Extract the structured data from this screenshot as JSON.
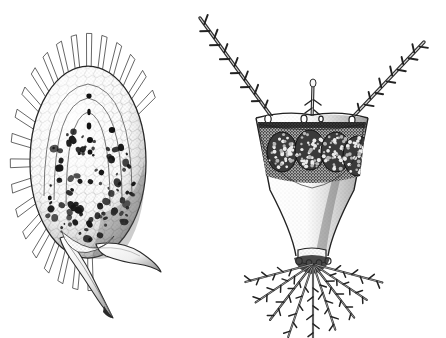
{
  "plate": {
    "title": "Zooplankton pen-and-ink plate",
    "width": 446,
    "height": 338,
    "background_color": "#ffffff",
    "ink_color": "#1a1a1a",
    "mid_tone_color": "#6e6e6e",
    "light_tone_color": "#c9c9c9",
    "technique": "stipple-and-line pen drawing",
    "figure_count": 2,
    "caption": "",
    "labels": []
  },
  "figures": [
    {
      "id": "left-specimen",
      "name": "loricate-rotifer-with-caudal-spines",
      "position": {
        "x": 18,
        "y": 22,
        "width": 150,
        "height": 300
      },
      "description": "Ovoid lorica crowned by a fan of radiating rectangular plates, interior densely packed with dark ovarian granules, terminating in two curved caudal spines.",
      "parts": [
        {
          "name": "apical-plate-crown",
          "count": 22,
          "shape": "radiating rectangular lappets",
          "span_degrees": 250,
          "note": "open fan around upper and left margin of lorica"
        },
        {
          "name": "lorica-body",
          "shape": "ovoid",
          "center": {
            "x": 88,
            "y": 160
          },
          "radius_x": 58,
          "radius_y": 95,
          "fill": "#f2f2f2",
          "texture": "fine reticulate stipple"
        },
        {
          "name": "concentric-inner-arcs",
          "count": 3,
          "note": "nested arcs echoing the dorsal outline"
        },
        {
          "name": "dark-granule-mass",
          "count": 96,
          "color": "#1a1a1a",
          "size_range_px": [
            2,
            7
          ],
          "note": "irregular blobs filling lower two-thirds of lorica"
        },
        {
          "name": "axial-dot-row",
          "count": 6,
          "note": "vertical line of dots on the midline above the granule mass"
        },
        {
          "name": "caudal-spine-lower",
          "direction": "down-left",
          "length_px": 95,
          "tip": {
            "x": 112,
            "y": 318
          },
          "note": "long tapering curved spine"
        },
        {
          "name": "caudal-spine-lateral",
          "direction": "right then hooking down",
          "length_px": 80,
          "tip": {
            "x": 160,
            "y": 272
          },
          "note": "shorter recurved hook-shaped spine"
        }
      ]
    },
    {
      "id": "right-specimen",
      "name": "horned-rotifer-with-bristle-fan",
      "position": {
        "x": 228,
        "y": 14,
        "width": 210,
        "height": 310
      },
      "description": "Goblet-shaped body bearing two long barbed antero-lateral horns, a short median antenna, a band of granular egg masses, a narrow waist and a spreading fan of barbed caudal bristles.",
      "parts": [
        {
          "name": "left-horn",
          "origin": {
            "x": 272,
            "y": 118
          },
          "tip": {
            "x": 200,
            "y": 18
          },
          "length_px": 124,
          "barb_count": 13,
          "note": "barbs angled outward and upward"
        },
        {
          "name": "right-horn",
          "origin": {
            "x": 352,
            "y": 118
          },
          "tip": {
            "x": 424,
            "y": 42
          },
          "length_px": 106,
          "barb_count": 12
        },
        {
          "name": "median-antenna",
          "origin": {
            "x": 312,
            "y": 118
          },
          "tip": {
            "x": 313,
            "y": 82
          },
          "length_px": 36,
          "barb_count": 4
        },
        {
          "name": "shoulder-pores",
          "count": 4,
          "note": "small circles at horn bases along the dorsal rim"
        },
        {
          "name": "dorsal-rim",
          "note": "shallow concave line joining the two shoulders"
        },
        {
          "name": "egg-mass-band",
          "lobe_count": 4,
          "fill": "#2a2a2a",
          "texture": "coarse circular stipple",
          "note": "dark granular band beneath the dorsal rim"
        },
        {
          "name": "body-trunk",
          "shape": "inverted bell tapering to a waist",
          "fill": "#f4f4f4",
          "texture": "fine stipple with shaded right flank"
        },
        {
          "name": "waist",
          "position": {
            "x": 312,
            "y": 248
          },
          "width_px": 26
        },
        {
          "name": "caudal-bristle-fan",
          "count": 9,
          "spread_degrees": 150,
          "note": "barbed setae radiating downward and outward from the foot"
        },
        {
          "name": "foot-pores",
          "count": 4,
          "note": "circles at the base of the bristle fan"
        }
      ]
    }
  ]
}
